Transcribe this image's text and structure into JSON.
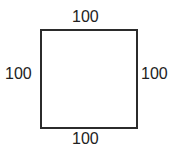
{
  "diagram": {
    "shape": "square",
    "labels": {
      "top": "100",
      "left": "100",
      "right": "100",
      "bottom": "100"
    },
    "stroke_color": "#2b2b2b"
  }
}
